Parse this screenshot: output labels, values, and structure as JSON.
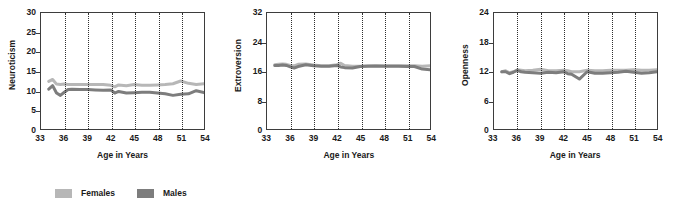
{
  "legend": {
    "position": "bottom-left",
    "entries": [
      {
        "label": "Females",
        "color": "#b7b7b7"
      },
      {
        "label": "Males",
        "color": "#7d7d7d"
      }
    ]
  },
  "chart_data": [
    {
      "type": "line",
      "title": "",
      "xlabel": "Age in Years",
      "ylabel": "Neuroticism",
      "xlim": [
        33,
        54
      ],
      "ylim": [
        0,
        30
      ],
      "xticks": [
        33,
        36,
        39,
        42,
        45,
        48,
        51,
        54
      ],
      "yticks": [
        0,
        5,
        10,
        15,
        20,
        25,
        30
      ],
      "grid": "vertical-dotted",
      "x": [
        34,
        34.5,
        35,
        35.5,
        36,
        36.5,
        37,
        38,
        39,
        40,
        41,
        42,
        42.5,
        43,
        44,
        45,
        46,
        47,
        48,
        49,
        50,
        51,
        52,
        53,
        54
      ],
      "series": [
        {
          "name": "Females",
          "color": "#b7b7b7",
          "values": [
            12.4,
            12.9,
            11.7,
            11.6,
            11.7,
            11.6,
            11.6,
            11.6,
            11.6,
            11.6,
            11.6,
            11.4,
            11.0,
            11.5,
            11.3,
            11.6,
            11.4,
            11.4,
            11.5,
            11.6,
            11.8,
            12.5,
            11.9,
            11.6,
            11.8
          ]
        },
        {
          "name": "Males",
          "color": "#7d7d7d",
          "values": [
            10.4,
            11.3,
            9.4,
            8.8,
            9.6,
            10.3,
            10.4,
            10.3,
            10.3,
            10.2,
            10.1,
            10.2,
            9.4,
            9.8,
            9.4,
            9.5,
            9.6,
            9.6,
            9.4,
            9.2,
            8.8,
            9.1,
            9.2,
            10.0,
            9.5
          ]
        }
      ]
    },
    {
      "type": "line",
      "title": "",
      "xlabel": "Age in Years",
      "ylabel": "Extroversion",
      "xlim": [
        33,
        54
      ],
      "ylim": [
        0,
        32
      ],
      "xticks": [
        33,
        36,
        39,
        42,
        45,
        48,
        51,
        54
      ],
      "yticks": [
        0,
        8,
        16,
        24,
        32
      ],
      "grid": "vertical-dotted",
      "x": [
        34,
        34.5,
        35,
        35.5,
        36,
        36.5,
        37,
        38,
        39,
        40,
        41,
        42,
        42.5,
        43,
        44,
        45,
        46,
        47,
        48,
        49,
        50,
        51,
        52,
        53,
        54
      ],
      "series": [
        {
          "name": "Females",
          "color": "#b7b7b7",
          "values": [
            17.8,
            17.9,
            18.0,
            17.9,
            17.6,
            17.5,
            17.9,
            18.0,
            17.7,
            17.5,
            17.5,
            17.8,
            18.2,
            17.6,
            17.4,
            17.4,
            17.5,
            17.6,
            17.5,
            17.5,
            17.5,
            17.5,
            17.5,
            17.4,
            17.5
          ]
        },
        {
          "name": "Males",
          "color": "#7d7d7d",
          "values": [
            17.6,
            17.6,
            17.7,
            17.6,
            17.2,
            16.9,
            17.3,
            17.8,
            17.5,
            17.4,
            17.4,
            17.6,
            17.2,
            17.0,
            16.9,
            17.3,
            17.4,
            17.4,
            17.4,
            17.4,
            17.4,
            17.3,
            17.3,
            16.6,
            16.4
          ]
        }
      ]
    },
    {
      "type": "line",
      "title": "",
      "xlabel": "Age in Years",
      "ylabel": "Openness",
      "xlim": [
        33,
        54
      ],
      "ylim": [
        0,
        24
      ],
      "xticks": [
        33,
        36,
        39,
        42,
        45,
        48,
        51,
        54
      ],
      "yticks": [
        0,
        6,
        12,
        18,
        24
      ],
      "grid": "vertical-dotted",
      "x": [
        34,
        34.5,
        35,
        35.5,
        36,
        36.5,
        37,
        38,
        39,
        40,
        41,
        42,
        42.5,
        43,
        44,
        45,
        46,
        47,
        48,
        49,
        50,
        51,
        52,
        53,
        54
      ],
      "series": [
        {
          "name": "Females",
          "color": "#b7b7b7",
          "values": [
            11.9,
            12.1,
            11.7,
            11.9,
            12.3,
            12.2,
            12.1,
            12.2,
            12.4,
            12.1,
            12.1,
            12.2,
            12.1,
            11.9,
            11.9,
            12.2,
            12.1,
            12.1,
            12.2,
            12.2,
            12.2,
            12.3,
            12.2,
            12.2,
            12.3
          ]
        },
        {
          "name": "Males",
          "color": "#7d7d7d",
          "values": [
            11.9,
            11.9,
            11.5,
            11.8,
            12.2,
            11.9,
            11.8,
            11.7,
            11.6,
            11.8,
            11.7,
            11.9,
            11.5,
            11.4,
            10.4,
            11.9,
            11.6,
            11.6,
            11.7,
            11.8,
            12.0,
            11.8,
            11.6,
            11.7,
            11.9
          ]
        }
      ]
    }
  ]
}
